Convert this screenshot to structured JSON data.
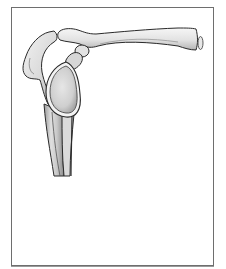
{
  "figure": {
    "style": "pencil-shaded line drawing in a thin rectangular frame",
    "parts": [
      {
        "name": "clavicle"
      },
      {
        "name": "acromion"
      },
      {
        "name": "coracoid-process"
      },
      {
        "name": "glenoid-fossa"
      },
      {
        "name": "scapula-neck"
      },
      {
        "name": "clavicle-cut-end"
      }
    ],
    "colors": {
      "frame": "#6e6e6e",
      "bone_fill": "#ececec",
      "bone_outline": "#2a2a2a",
      "glenoid_fill": "#d6d6d6",
      "background": "#ffffff"
    }
  }
}
